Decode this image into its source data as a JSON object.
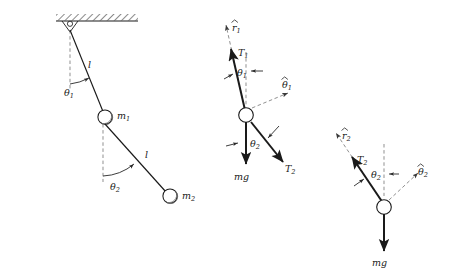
{
  "figure": {
    "stroke_color": "#1a1a1a",
    "dashed_color": "#8a8a8a",
    "bob_fill": "#ffffff"
  },
  "pendulum": {
    "name": "double-pendulum",
    "ceiling_label": "",
    "rod1_length_label": "l",
    "rod2_length_label": "l",
    "angle1_label": "θ",
    "angle1_sub": "1",
    "angle2_label": "θ",
    "angle2_sub": "2",
    "mass1_label": "m",
    "mass1_sub": "1",
    "mass2_label": "m",
    "mass2_sub": "2"
  },
  "fbd1": {
    "name": "free-body-diagram-mass-1",
    "rhat_label": "r",
    "rhat_sub": "1",
    "tension1_label": "T",
    "tension1_sub": "1",
    "tension2_label": "T",
    "tension2_sub": "2",
    "angle1_label": "θ",
    "angle1_sub": "1",
    "thetahat_label": "θ",
    "thetahat_sub": "1",
    "angle2_label": "θ",
    "angle2_sub": "2",
    "weight_label": "mg"
  },
  "fbd2": {
    "name": "free-body-diagram-mass-2",
    "rhat_label": "r",
    "rhat_sub": "2",
    "tension2_label": "T",
    "tension2_sub": "2",
    "angle2_label": "θ",
    "angle2_sub": "2",
    "thetahat_label": "θ",
    "thetahat_sub": "2",
    "weight_label": "mg"
  }
}
